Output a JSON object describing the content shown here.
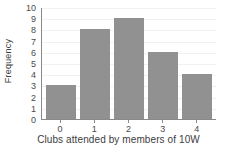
{
  "chart_data": {
    "type": "bar",
    "title": "",
    "xlabel": "Clubs attended by members of 10W",
    "ylabel": "Frequency",
    "categories": [
      "0",
      "1",
      "2",
      "3",
      "4"
    ],
    "values": [
      3,
      8,
      9,
      6,
      4
    ],
    "ylim": [
      0,
      10
    ],
    "yticks": [
      "0",
      "1",
      "2",
      "3",
      "4",
      "5",
      "6",
      "7",
      "8",
      "9",
      "10"
    ],
    "grid": true,
    "legend": "none",
    "colors": {
      "bar": "#919191",
      "axis": "#8a8a8a",
      "grid": "#f1f1f1",
      "text": "#3d3d3d",
      "background": "#ffffff"
    }
  }
}
